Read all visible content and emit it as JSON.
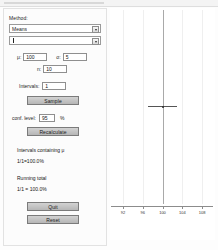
{
  "window": {
    "title": ""
  },
  "panel": {
    "method_label": "Method:",
    "method_select": {
      "value": "Means",
      "options": [
        "Means",
        "Proportions"
      ],
      "arrow_icon": "chevron-down-icon"
    },
    "statistic_select": {
      "value": "",
      "options": [
        "",
        "z",
        "t"
      ],
      "arrow_icon": "chevron-down-icon"
    },
    "mu_label": "μ:",
    "mu_value": "100",
    "sigma_label": "σ:",
    "sigma_value": "5",
    "n_label": "n:",
    "n_value": "10",
    "intervals_label": "Intervals:",
    "intervals_value": "1",
    "sample_button": "Sample",
    "conf_level_label": "conf. level:",
    "conf_level_value": "95",
    "percent_symbol": "%",
    "recalculate_button": "Recalculate",
    "intervals_containing_heading": "Intervals containing μ",
    "intervals_containing_value": "1/1=100.0%",
    "running_total_heading": "Running total",
    "running_total_value": "1/1 = 100.0%",
    "quit_button": "Quit",
    "reset_button": "Reset"
  },
  "chart_data": {
    "type": "scatter",
    "title": "",
    "xlabel": "",
    "ylabel": "",
    "xlim": [
      90,
      110
    ],
    "ticks": [
      92,
      96,
      100,
      104,
      108
    ],
    "gridlines": [
      92,
      96,
      100,
      104,
      108
    ],
    "reference_line": 100,
    "grid": true,
    "legend": false,
    "intervals": [
      {
        "center": 100.0,
        "lower": 97.0,
        "upper": 103.0,
        "y": 0.5,
        "contains_mu": true
      }
    ]
  }
}
